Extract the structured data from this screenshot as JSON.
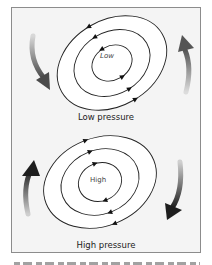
{
  "diagram": {
    "low": {
      "title": "Low pressure",
      "center_label": "Low",
      "rotation": "counterclockwise",
      "surrounding_arrows": [
        "down-left",
        "up-right"
      ]
    },
    "high": {
      "title": "High pressure",
      "center_label": "High",
      "rotation": "clockwise",
      "surrounding_arrows": [
        "up-left",
        "down-right"
      ]
    },
    "caption_partially_visible": true,
    "colors": {
      "frame_border": "#8c8c8c",
      "frame_fill": "#f4f4f4",
      "isobar": "#222222",
      "arrow_dark": "#2a2a2a",
      "arrow_mid": "#6a6a6a"
    }
  }
}
